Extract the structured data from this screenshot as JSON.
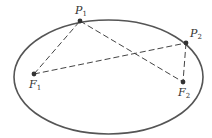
{
  "diagram": {
    "type": "ellipse-foci",
    "ellipse": {
      "cx": 108.5,
      "cy": 77,
      "rx": 94.5,
      "ry": 57,
      "stroke": "#555555"
    },
    "points": {
      "P1": {
        "label": "P",
        "sub": "1",
        "x": 80,
        "y": 21
      },
      "P2": {
        "label": "P",
        "sub": "2",
        "x": 186,
        "y": 43
      },
      "F1": {
        "label": "F",
        "sub": "1",
        "x": 34,
        "y": 74
      },
      "F2": {
        "label": "F",
        "sub": "2",
        "x": 183,
        "y": 82
      }
    },
    "segments": [
      {
        "from": "F1",
        "to": "P1",
        "style": "dashed"
      },
      {
        "from": "P1",
        "to": "F2",
        "style": "dashed"
      },
      {
        "from": "F1",
        "to": "P2",
        "style": "dashed"
      },
      {
        "from": "P2",
        "to": "F2",
        "style": "dashed"
      }
    ],
    "colors": {
      "line": "#444444",
      "point": "#333333",
      "label": "#333333"
    }
  }
}
